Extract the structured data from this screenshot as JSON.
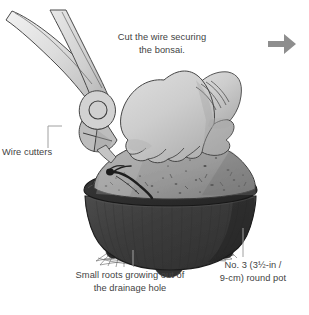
{
  "figure": {
    "title": "Cut the wire securing the bonsai",
    "width": 309,
    "height": 315,
    "background_color": "#ffffff"
  },
  "captions": {
    "main_instruction": "Cut the wire securing\nthe bonsai.",
    "wire_cutters": "Wire cutters",
    "small_roots": "Small roots growing out of\nthe drainage hole",
    "pot_spec": "No. 3 (3½-in /\n9-cm) round pot"
  },
  "icons": {
    "next_step_arrow": "arrow-right-icon"
  },
  "colors": {
    "text": "#434343",
    "leader_line": "#9b9b9b",
    "arrow": "#8e8e8e",
    "pot_body": "#3c3c3c",
    "pot_rim": "#2c2c2c",
    "soil": "#9b9b9b",
    "soil_speckle": "#3a3a3a",
    "hand": "#c9c9c9",
    "hand_shadow": "#a8a8a8",
    "tool_metal": "#d5d5d5",
    "tool_outline": "#4a4a4a",
    "wire": "#262626",
    "outline": "#3a3a3a"
  },
  "illustration_parts": {
    "wire_cutters": "wire-cutters-tool",
    "hand": "hand-holding-root-ball",
    "root_ball": "soil-root-ball",
    "pot": "round-bonsai-pot",
    "roots": "roots-through-drainage-hole",
    "wire": "securing-wire"
  }
}
